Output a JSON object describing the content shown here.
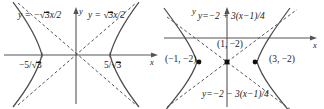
{
  "figure": {
    "panels": [
      {
        "id": "left",
        "name": "hyperbola-standard",
        "axis_x_label": "x",
        "axis_y_label": "y",
        "labels": {
          "asymptote_left": "y = −√3x/2",
          "asymptote_right": "y = √3x/2",
          "vertex_left": "−5/√3",
          "vertex_right": "5/√3"
        },
        "asymptote_left_parts": {
          "lhs": "y = −",
          "radicand": "3",
          "tail": "x/2"
        },
        "asymptote_right_parts": {
          "lhs": "y = ",
          "radicand": "3",
          "tail": "x/2"
        },
        "vertex_left_parts": {
          "lead": "−5/",
          "radicand": "3"
        },
        "vertex_right_parts": {
          "lead": "5/",
          "radicand": "3"
        },
        "geometry": {
          "origin_x": 76,
          "origin_y": 55,
          "opens": "horizontal",
          "vertex_offset_px": 34,
          "asymptote_slope": 0.866
        }
      },
      {
        "id": "right",
        "name": "hyperbola-translated",
        "axis_x_label": "x",
        "axis_y_label": "y",
        "labels": {
          "asymptote_top": "y=−2 + 3(x−1)/4",
          "asymptote_bottom": "y=−2 − 3(x−1)/4",
          "point_left": "(−1, −2)",
          "point_center": "(1, −2)",
          "point_right": "(3, −2)"
        },
        "points": [
          {
            "label": "(−1, −2)",
            "x": -1,
            "y": -2,
            "kind": "vertex"
          },
          {
            "label": "(1, −2)",
            "x": 1,
            "y": -2,
            "kind": "center"
          },
          {
            "label": "(3, −2)",
            "x": 3,
            "y": -2,
            "kind": "vertex"
          }
        ],
        "geometry": {
          "origin_x": 65,
          "origin_y": 38,
          "center_px_x": 65,
          "center_px_y": 62,
          "opens": "horizontal",
          "vertex_offset_px": 26,
          "asymptote_slope": 0.75
        }
      }
    ],
    "style": {
      "curve_color": "#4d4d4d",
      "asymptote_color": "#555555",
      "axis_color": "#555555",
      "point_color": "#111111",
      "background": "#ffffff"
    }
  }
}
